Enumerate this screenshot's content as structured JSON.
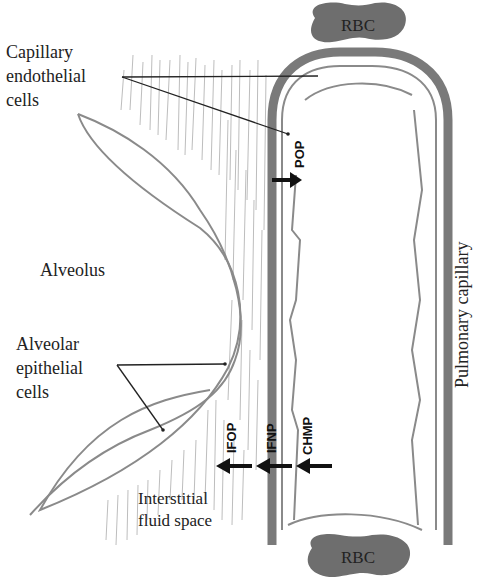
{
  "diagram": {
    "labels": {
      "capillary_endothelial": [
        "Capillary",
        "endothelial",
        "cells"
      ],
      "alveolus": "Alveolus",
      "alveolar_epithelial": [
        "Alveolar",
        "epithelial",
        "cells"
      ],
      "interstitial": [
        "Interstitial",
        "fluid space"
      ],
      "pulmonary_capillary": "Pulmonary capillary",
      "rbc_top": "RBC",
      "rbc_bottom": "RBC"
    },
    "forces": [
      {
        "id": "pop",
        "label": "POP",
        "direction": "into-capillary"
      },
      {
        "id": "ifop",
        "label": "IFOP",
        "direction": "out-of-capillary"
      },
      {
        "id": "ifnp",
        "label": "IFNP",
        "direction": "out-of-capillary"
      },
      {
        "id": "chmp",
        "label": "CHMP",
        "direction": "out-of-capillary"
      }
    ],
    "colors": {
      "wall": "#7a7a7a",
      "rbc": "#6e6e6e",
      "outline": "#8a8a8a",
      "text": "#222222",
      "hatch": "#b8b8b8"
    }
  }
}
